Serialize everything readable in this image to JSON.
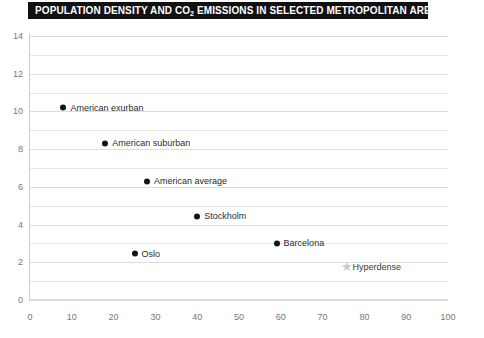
{
  "title": {
    "prefix": "POPULATION DENSITY AND CO",
    "subscript": "2",
    "suffix": " EMISSIONS IN SELECTED METROPOLITAN AREAS",
    "background_color": "#111111",
    "text_color": "#ffffff"
  },
  "chart_data": {
    "type": "scatter",
    "title": "POPULATION DENSITY AND CO2 EMISSIONS IN SELECTED METROPOLITAN AREAS",
    "xlabel": "",
    "ylabel": "",
    "xlim": [
      0,
      100
    ],
    "ylim": [
      0,
      14
    ],
    "grid": true,
    "grid_step_y": 1,
    "legend": "none",
    "xticks": [
      "0",
      "10",
      "20",
      "30",
      "40",
      "50",
      "60",
      "70",
      "80",
      "90",
      "100"
    ],
    "yticks": [
      "0",
      "2",
      "4",
      "6",
      "8",
      "10",
      "12",
      "14"
    ],
    "points": [
      {
        "label": "American exurban",
        "x": 8,
        "y": 10.2,
        "marker": "dot",
        "color": "#141414"
      },
      {
        "label": "American suburban",
        "x": 18,
        "y": 8.3,
        "marker": "dot",
        "color": "#141414"
      },
      {
        "label": "American average",
        "x": 28,
        "y": 6.3,
        "marker": "dot",
        "color": "#141414"
      },
      {
        "label": "Stockholm",
        "x": 40,
        "y": 4.45,
        "marker": "dot",
        "color": "#141414"
      },
      {
        "label": "Oslo",
        "x": 25,
        "y": 2.45,
        "marker": "dot",
        "color": "#141414"
      },
      {
        "label": "Barcelona",
        "x": 59,
        "y": 3.0,
        "marker": "dot",
        "color": "#141414"
      },
      {
        "label": "Hyperdense",
        "x": 75,
        "y": 1.75,
        "marker": "star",
        "color": "#c9c9c9"
      }
    ]
  }
}
